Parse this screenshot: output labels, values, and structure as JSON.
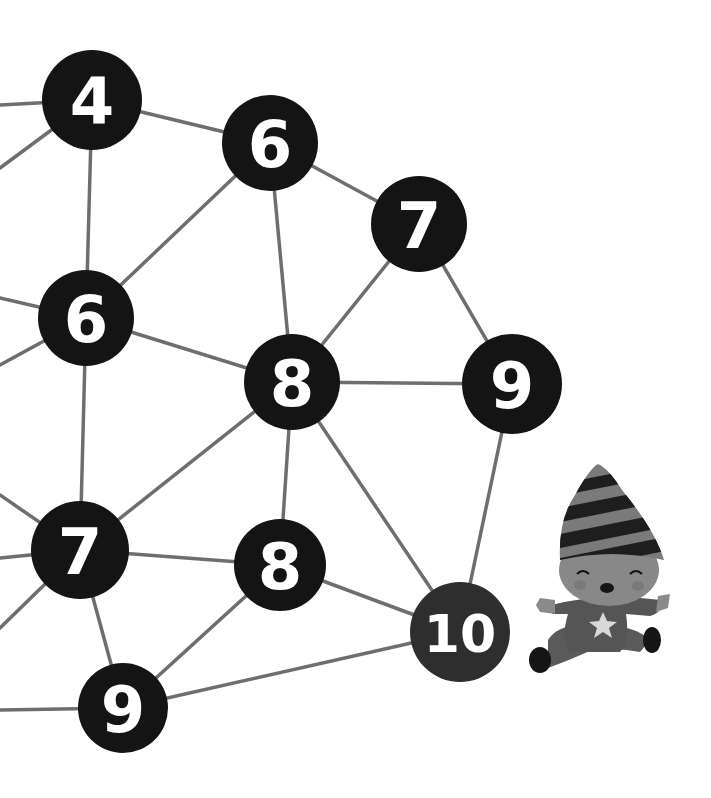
{
  "illustration": {
    "description": "Hand-drawn network of numbered black circles connected by grey lines, with a small child in a striped party hat sitting at bottom right",
    "colors": {
      "background": "#ffffff",
      "node_fill": "#141414",
      "node_text": "#ffffff",
      "edge": "#6e6e6e",
      "hat_stripe_dark": "#1e1e1e",
      "hat_stripe_light": "#7a7a7a",
      "face": "#8a8a8a",
      "body": "#5a5a5a",
      "star": "#d8d8d8"
    },
    "nodes": [
      {
        "id": "n4",
        "label": "4",
        "x": 92,
        "y": 100,
        "r": 50
      },
      {
        "id": "n6a",
        "label": "6",
        "x": 270,
        "y": 143,
        "r": 48
      },
      {
        "id": "n7a",
        "label": "7",
        "x": 419,
        "y": 224,
        "r": 48
      },
      {
        "id": "n6b",
        "label": "6",
        "x": 86,
        "y": 318,
        "r": 48
      },
      {
        "id": "n8a",
        "label": "8",
        "x": 292,
        "y": 382,
        "r": 48
      },
      {
        "id": "n9a",
        "label": "9",
        "x": 512,
        "y": 384,
        "r": 50
      },
      {
        "id": "n7b",
        "label": "7",
        "x": 80,
        "y": 550,
        "r": 49
      },
      {
        "id": "n8b",
        "label": "8",
        "x": 280,
        "y": 565,
        "r": 46
      },
      {
        "id": "n10",
        "label": "10",
        "x": 460,
        "y": 632,
        "r": 50
      },
      {
        "id": "n9b",
        "label": "9",
        "x": 123,
        "y": 708,
        "r": 45
      }
    ],
    "edges": [
      [
        "n4",
        "n6a"
      ],
      [
        "n4",
        "n6b"
      ],
      [
        "n6a",
        "n6b"
      ],
      [
        "n6a",
        "n7a"
      ],
      [
        "n6a",
        "n8a"
      ],
      [
        "n7a",
        "n8a"
      ],
      [
        "n7a",
        "n9a"
      ],
      [
        "n6b",
        "n8a"
      ],
      [
        "n6b",
        "n7b"
      ],
      [
        "n8a",
        "n9a"
      ],
      [
        "n8a",
        "n7b"
      ],
      [
        "n8a",
        "n8b"
      ],
      [
        "n8a",
        "n10"
      ],
      [
        "n9a",
        "n10"
      ],
      [
        "n7b",
        "n8b"
      ],
      [
        "n7b",
        "n9b"
      ],
      [
        "n8b",
        "n9b"
      ],
      [
        "n8b",
        "n10"
      ],
      [
        "n9b",
        "n10"
      ]
    ],
    "offscreen_edges": [
      {
        "from": "n4",
        "to": [
          0,
          105
        ]
      },
      {
        "from": "n4",
        "to": [
          0,
          168
        ]
      },
      {
        "from": "n6b",
        "to": [
          0,
          298
        ]
      },
      {
        "from": "n6b",
        "to": [
          0,
          365
        ]
      },
      {
        "from": "n7b",
        "to": [
          0,
          495
        ]
      },
      {
        "from": "n7b",
        "to": [
          0,
          558
        ]
      },
      {
        "from": "n7b",
        "to": [
          0,
          628
        ]
      },
      {
        "from": "n9b",
        "to": [
          0,
          710
        ]
      }
    ],
    "character": {
      "name": "party-hat-child",
      "x": 530,
      "y": 462
    }
  }
}
